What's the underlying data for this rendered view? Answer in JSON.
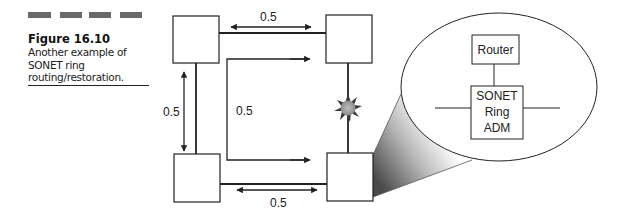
{
  "figure": {
    "number": "Figure 16.10",
    "caption_lines": [
      "Another example of",
      "SONET ring",
      "routing/restoration."
    ],
    "header_bars": 4
  },
  "diagram": {
    "nodes": [
      {
        "id": "top-left",
        "label": ""
      },
      {
        "id": "top-right",
        "label": ""
      },
      {
        "id": "bottom-left",
        "label": ""
      },
      {
        "id": "bottom-right",
        "label": ""
      }
    ],
    "links": [
      {
        "from": "top-left",
        "to": "top-right",
        "capacity_label": "0.5"
      },
      {
        "from": "top-left",
        "to": "bottom-left",
        "capacity_label": "0.5"
      },
      {
        "from": "bottom-left",
        "to": "bottom-right",
        "capacity_label": "0.5"
      },
      {
        "from": "top-right",
        "to": "bottom-right",
        "capacity_label": "",
        "status": "failed"
      }
    ],
    "reroute_label": "0.5",
    "labels": {
      "top": "0.5",
      "left": "0.5",
      "inner": "0.5",
      "bottom": "0.5"
    },
    "failure_marker": "burst",
    "callout": {
      "router_label": "Router",
      "adm_label_lines": [
        "SONET",
        "Ring",
        "ADM"
      ]
    }
  }
}
